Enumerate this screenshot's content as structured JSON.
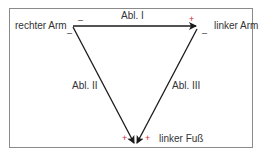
{
  "diagram": {
    "vertices": {
      "right_arm": "rechter  Arm",
      "left_arm": "linker Arm",
      "left_foot": "linker Fuß"
    },
    "leads": {
      "lead1": "Abl. I",
      "lead2": "Abl. II",
      "lead3": "Abl. III"
    },
    "signs": {
      "minus": "–",
      "plus": "+"
    },
    "colors": {
      "plus": "#d9283a",
      "line": "#1a1a1a"
    }
  }
}
